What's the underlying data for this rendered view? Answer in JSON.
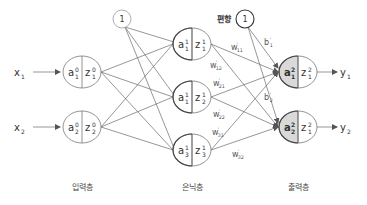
{
  "diagram": {
    "colors": {
      "line": "#6a6a6a",
      "node_stroke": "#777777",
      "output_fill": "#d9d9d9",
      "text": "#333333"
    },
    "inputs": [
      {
        "id": "x1",
        "label": "x",
        "sub": "1",
        "y": 72
      },
      {
        "id": "x2",
        "label": "x",
        "sub": "2",
        "y": 127
      }
    ],
    "layers": [
      {
        "name": "input",
        "label": "입력층",
        "label_x": 82,
        "nodes": [
          {
            "a": "a",
            "a_sup": "0",
            "a_sub": "1",
            "z": "z",
            "z_sup": "0",
            "z_sub": "1",
            "cx": 82,
            "cy": 72
          },
          {
            "a": "a",
            "a_sup": "0",
            "a_sub": "2",
            "z": "z",
            "z_sup": "0",
            "z_sub": "2",
            "cx": 82,
            "cy": 127
          }
        ],
        "bias": {
          "label": "1",
          "cx": 122,
          "cy": 19
        }
      },
      {
        "name": "hidden",
        "label": "은닉층",
        "label_x": 192,
        "nodes": [
          {
            "a": "a",
            "a_sup": "1",
            "a_sub": "1",
            "z": "z",
            "z_sup": "1",
            "z_sub": "1",
            "cx": 192,
            "cy": 44
          },
          {
            "a": "a",
            "a_sup": "1",
            "a_sub": "1",
            "z": "z",
            "z_sup": "1",
            "z_sub": "2",
            "cx": 192,
            "cy": 97
          },
          {
            "a": "a",
            "a_sup": "1",
            "a_sub": "3",
            "z": "z",
            "z_sup": "1",
            "z_sub": "3",
            "cx": 192,
            "cy": 150
          }
        ],
        "bias": {
          "label": "1",
          "caption": "편향",
          "cx": 245,
          "cy": 19
        }
      },
      {
        "name": "output",
        "label": "출력층",
        "label_x": 298,
        "nodes": [
          {
            "a": "a",
            "a_sup": "2",
            "a_sub": "1",
            "z": "z",
            "z_sup": "2",
            "z_sub": "1",
            "cx": 298,
            "cy": 72
          },
          {
            "a": "a",
            "a_sup": "2",
            "a_sub": "2",
            "z": "z",
            "z_sup": "2",
            "z_sub": "1",
            "cx": 298,
            "cy": 127
          }
        ]
      }
    ],
    "outputs": [
      {
        "id": "y1",
        "label": "y",
        "sub": "1",
        "y": 72
      },
      {
        "id": "y2",
        "label": "y",
        "sub": "2",
        "y": 127
      }
    ],
    "weight_labels": [
      {
        "text": "w",
        "sup": "'",
        "sub": "11",
        "x": 231,
        "y": 50
      },
      {
        "text": "w",
        "sup": "'",
        "sub": "12",
        "x": 210,
        "y": 68
      },
      {
        "text": "w",
        "sup": "'",
        "sub": "21",
        "x": 213,
        "y": 86
      },
      {
        "text": "w",
        "sup": "'",
        "sub": "22",
        "x": 213,
        "y": 117
      },
      {
        "text": "w",
        "sup": "'",
        "sub": "31",
        "x": 212,
        "y": 135
      },
      {
        "text": "w",
        "sup": "'",
        "sub": "32",
        "x": 232,
        "y": 157
      }
    ],
    "bias_labels": [
      {
        "text": "b",
        "sup": "'",
        "sub": "1",
        "x": 264,
        "y": 45
      },
      {
        "text": "b",
        "sup": "'",
        "sub": "2",
        "x": 264,
        "y": 100
      }
    ]
  }
}
